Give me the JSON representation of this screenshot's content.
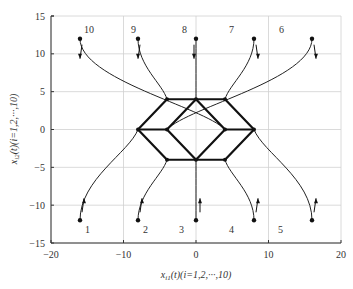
{
  "chart_data": {
    "type": "line",
    "title": "",
    "xlabel": "x_i1(t)(i=1,2,···,10)",
    "ylabel": "x_i2(t)(i=1,2,···,10)",
    "xlim": [
      -20,
      20
    ],
    "ylim": [
      -15,
      15
    ],
    "xticks": [
      -20,
      -10,
      0,
      10,
      20
    ],
    "yticks": [
      -15,
      -10,
      -5,
      0,
      5,
      10,
      15
    ],
    "grid": true,
    "legend": null,
    "agents": [
      {
        "id": 1,
        "start": [
          -16,
          -12
        ],
        "final": [
          -8,
          0
        ],
        "direction": "up"
      },
      {
        "id": 2,
        "start": [
          -8,
          -12
        ],
        "final": [
          -4,
          -4
        ],
        "direction": "up"
      },
      {
        "id": 3,
        "start": [
          0,
          -12
        ],
        "final": [
          0,
          -4
        ],
        "direction": "up"
      },
      {
        "id": 4,
        "start": [
          8,
          -12
        ],
        "final": [
          4,
          -4
        ],
        "direction": "up"
      },
      {
        "id": 5,
        "start": [
          16,
          -12
        ],
        "final": [
          8,
          0
        ],
        "direction": "up"
      },
      {
        "id": 6,
        "start": [
          16,
          12
        ],
        "final": [
          -4,
          0
        ],
        "direction": "down"
      },
      {
        "id": 7,
        "start": [
          8,
          12
        ],
        "final": [
          4,
          4
        ],
        "direction": "down"
      },
      {
        "id": 8,
        "start": [
          0,
          12
        ],
        "final": [
          0,
          4
        ],
        "direction": "down"
      },
      {
        "id": 9,
        "start": [
          -8,
          12
        ],
        "final": [
          -4,
          4
        ],
        "direction": "down"
      },
      {
        "id": 10,
        "start": [
          -16,
          12
        ],
        "final": [
          4,
          0
        ],
        "direction": "down"
      }
    ],
    "formation": {
      "nodes": [
        [
          -8,
          0
        ],
        [
          -4,
          4
        ],
        [
          0,
          4
        ],
        [
          4,
          4
        ],
        [
          8,
          0
        ],
        [
          4,
          -4
        ],
        [
          0,
          -4
        ],
        [
          -4,
          -4
        ],
        [
          -4,
          0
        ],
        [
          4,
          0
        ]
      ],
      "edges": [
        [
          [
            -8,
            0
          ],
          [
            -4,
            4
          ]
        ],
        [
          [
            -4,
            4
          ],
          [
            4,
            4
          ]
        ],
        [
          [
            4,
            4
          ],
          [
            8,
            0
          ]
        ],
        [
          [
            8,
            0
          ],
          [
            4,
            -4
          ]
        ],
        [
          [
            4,
            -4
          ],
          [
            -4,
            -4
          ]
        ],
        [
          [
            -4,
            -4
          ],
          [
            -8,
            0
          ]
        ],
        [
          [
            0,
            4
          ],
          [
            -4,
            0
          ]
        ],
        [
          [
            -4,
            0
          ],
          [
            0,
            -4
          ]
        ],
        [
          [
            0,
            -4
          ],
          [
            4,
            0
          ]
        ],
        [
          [
            4,
            0
          ],
          [
            0,
            4
          ]
        ],
        [
          [
            -8,
            0
          ],
          [
            -4,
            0
          ]
        ],
        [
          [
            4,
            0
          ],
          [
            8,
            0
          ]
        ]
      ]
    },
    "colors": {
      "trajectory": "#222222",
      "formation": "#111111",
      "grid": "#d0d0d0",
      "axis": "#333333"
    }
  },
  "axes": {
    "x_label_main": "x",
    "x_label_sub": "i1",
    "x_label_rest": "(t)(i=1,2,···,10)",
    "y_label_main": "x",
    "y_label_sub": "i2",
    "y_label_rest": "(t)(i=1,2,···,10)"
  }
}
